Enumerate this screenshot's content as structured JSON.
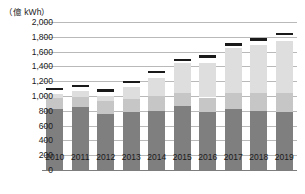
{
  "chart_data": {
    "type": "bar",
    "title": "",
    "subtitle": "",
    "unit_label": "（億 kWh）",
    "xlabel": "",
    "ylabel": "億 kWh",
    "ylim": [
      0,
      2000
    ],
    "ytick_step": 200,
    "grid": true,
    "legend_position": "none",
    "stacked": true,
    "categories": [
      "2010",
      "2011",
      "2012",
      "2013",
      "2014",
      "2015",
      "2016",
      "2017",
      "2018",
      "2019"
    ],
    "ytick_labels": [
      "2,000",
      "1,800",
      "1,600",
      "1,400",
      "1,200",
      "1,000",
      "800",
      "600",
      "400",
      "200",
      "0"
    ],
    "ytick_values": [
      2000,
      1800,
      1600,
      1400,
      1200,
      1000,
      800,
      600,
      400,
      200,
      0
    ],
    "series": [
      {
        "name": "lower-segment",
        "color": "#807f80",
        "values": [
          830,
          850,
          755,
          780,
          800,
          865,
          785,
          825,
          800,
          780
        ]
      },
      {
        "name": "middle-segment",
        "color": "#c6c6c6",
        "values": [
          140,
          135,
          175,
          185,
          195,
          170,
          195,
          210,
          235,
          255
        ]
      },
      {
        "name": "upper-segment",
        "color": "#dedede",
        "values": [
          60,
          85,
          70,
          155,
          255,
          415,
          460,
          615,
          655,
          715
        ]
      }
    ],
    "stack_tops": [
      1030,
      1070,
      1000,
      1120,
      1250,
      1450,
      1440,
      1650,
      1690,
      1750
    ],
    "total_markers": {
      "name": "total-marker",
      "color": "#1a1a1a",
      "values": [
        1080,
        1120,
        1060,
        1170,
        1310,
        1470,
        1520,
        1680,
        1750,
        1820
      ]
    }
  }
}
